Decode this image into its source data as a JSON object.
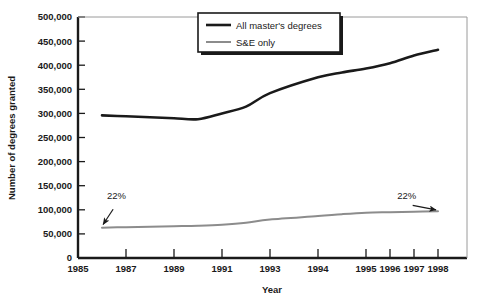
{
  "chart_data": {
    "type": "line",
    "title": "",
    "xlabel": "Year",
    "ylabel": "Number of degrees granted",
    "xlim": [
      1985,
      1999
    ],
    "ylim": [
      0,
      500000
    ],
    "grid": false,
    "legend_position": "top-center",
    "x_tick_labels": [
      "1985",
      "1987",
      "1989",
      "1991",
      "1993",
      "1994",
      "1995",
      "1996",
      "1997",
      "1998"
    ],
    "x_tick_values": [
      1985,
      1987,
      1989,
      1991,
      1993,
      1994,
      1995,
      1996,
      1997,
      1998
    ],
    "y_tick_labels": [
      "0",
      "50,000",
      "100,000",
      "150,000",
      "200,000",
      "250,000",
      "300,000",
      "350,000",
      "400,000",
      "450,000",
      "500,000"
    ],
    "y_tick_values": [
      0,
      50000,
      100000,
      150000,
      200000,
      250000,
      300000,
      350000,
      400000,
      450000,
      500000
    ],
    "x": [
      1986,
      1987,
      1988,
      1989,
      1990,
      1991,
      1992,
      1993,
      1994,
      1995,
      1996,
      1997,
      1998,
      1998.5
    ],
    "series": [
      {
        "name": "All master's degrees",
        "color": "#1a1a1a",
        "values": [
          296000,
          294000,
          292000,
          290000,
          288000,
          300000,
          314000,
          342000,
          375000,
          385000,
          393000,
          404000,
          420000,
          432000
        ]
      },
      {
        "name": "S&E only",
        "color": "#8c8c8c",
        "values": [
          63000,
          64000,
          65000,
          66000,
          67000,
          69000,
          73000,
          80000,
          87000,
          91000,
          94000,
          95000,
          96000,
          97000
        ]
      }
    ],
    "annotations": [
      {
        "text": "22%",
        "label_x": 1986.6,
        "label_y": 122000,
        "target_x": 1986.0,
        "target_y": 66000
      },
      {
        "text": "22%",
        "label_x": 1997.7,
        "label_y": 122000,
        "target_x": 1998.5,
        "target_y": 99000
      }
    ]
  },
  "legend": {
    "items": [
      {
        "label": "All master's degrees",
        "color": "#1a1a1a",
        "width": 2.6
      },
      {
        "label": "S&E only",
        "color": "#8c8c8c",
        "width": 2.0
      }
    ]
  },
  "axes": {
    "y_title": "Number of degrees granted",
    "x_title": "Year"
  }
}
